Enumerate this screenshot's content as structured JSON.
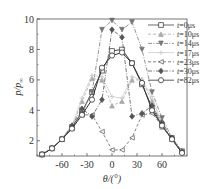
{
  "chart_data": {
    "type": "line",
    "title": "",
    "xlabel": "θ/(°)",
    "ylabel": "p/p∞",
    "xlim": [
      -90,
      90
    ],
    "ylim": [
      1,
      10
    ],
    "x_ticks": [
      -60,
      -30,
      0,
      30,
      60
    ],
    "y_ticks": [
      2,
      4,
      6,
      8,
      10
    ],
    "grid": false,
    "legend_position": "upper right",
    "x": [
      -84,
      -72,
      -60,
      -48,
      -36,
      -24,
      -12,
      0,
      12,
      24,
      36,
      48,
      60,
      72,
      84
    ],
    "series": [
      {
        "name": "t=0μs",
        "style": "solid",
        "marker": "square",
        "color": "#444444",
        "values": [
          1.1,
          1.5,
          2.1,
          2.9,
          3.9,
          5.2,
          6.6,
          7.9,
          8.0,
          7.1,
          5.7,
          4.2,
          3.0,
          2.1,
          1.3
        ]
      },
      {
        "name": "t=10μs",
        "style": "dashed",
        "marker": "triangle-up",
        "color": "#aaaaaa",
        "values": [
          1.1,
          1.5,
          2.1,
          2.9,
          4.6,
          6.1,
          6.0,
          4.3,
          4.6,
          6.0,
          6.0,
          4.6,
          2.9,
          2.1,
          1.3
        ]
      },
      {
        "name": "t=14μs",
        "style": "dashdot",
        "marker": "triangle-down",
        "color": "#777777",
        "values": [
          1.1,
          1.5,
          2.1,
          2.9,
          3.8,
          5.2,
          9.3,
          9.9,
          9.3,
          9.8,
          8.0,
          5.2,
          3.5,
          2.2,
          1.3
        ]
      },
      {
        "name": "t=17μs",
        "style": "solid-light",
        "marker": "plus",
        "color": "#cccccc",
        "values": [
          1.1,
          1.5,
          2.2,
          3.0,
          4.8,
          6.3,
          6.2,
          4.9,
          4.8,
          6.2,
          6.0,
          4.9,
          3.1,
          2.1,
          1.3
        ]
      },
      {
        "name": "t=23μs",
        "style": "dashed",
        "marker": "triangle-left",
        "color": "#666666",
        "values": [
          1.1,
          1.5,
          2.1,
          2.8,
          3.7,
          3.7,
          2.6,
          1.4,
          1.4,
          2.2,
          3.7,
          3.8,
          3.0,
          2.1,
          1.2
        ]
      },
      {
        "name": "t=30μs",
        "style": "dashdot",
        "marker": "diamond",
        "color": "#555555",
        "values": [
          1.1,
          1.5,
          2.1,
          3.0,
          4.1,
          3.6,
          4.7,
          9.3,
          8.8,
          3.6,
          3.8,
          4.3,
          3.2,
          2.2,
          1.3
        ]
      },
      {
        "name": "t=82μs",
        "style": "solid",
        "marker": "circle",
        "color": "#333333",
        "values": [
          1.1,
          1.5,
          2.1,
          2.8,
          3.7,
          4.7,
          6.8,
          7.6,
          7.8,
          7.1,
          5.8,
          4.0,
          3.0,
          2.1,
          1.2
        ]
      }
    ]
  },
  "axes": {
    "xlabel": "θ/(°)",
    "ylabel_main": "p",
    "ylabel_sub": "∞",
    "x_tick_labels": [
      "-60",
      "-30",
      "0",
      "30",
      "60"
    ],
    "y_tick_labels": [
      "2",
      "4",
      "6",
      "8",
      "10"
    ]
  },
  "legend": [
    "t=0μs",
    "t=10μs",
    "t=14μs",
    "t=17μs",
    "t=23μs",
    "t=30μs",
    "t=82μs"
  ]
}
